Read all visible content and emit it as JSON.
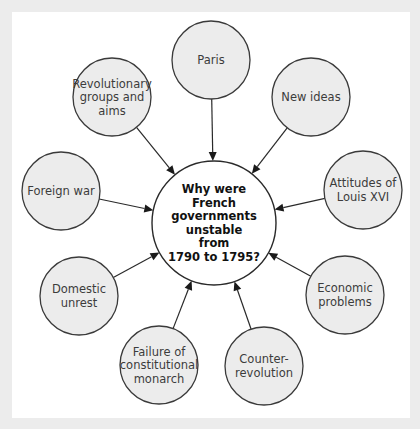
{
  "diagram": {
    "type": "spider",
    "central_question": {
      "lines": [
        "Why were",
        "French",
        "governments",
        "unstable",
        "from",
        "1790 to 1795?"
      ]
    },
    "factors": [
      {
        "id": "paris",
        "lines": [
          "Paris"
        ]
      },
      {
        "id": "new-ideas",
        "lines": [
          "New ideas"
        ]
      },
      {
        "id": "attitudes-louis-xvi",
        "lines": [
          "Attitudes of",
          "Louis XVI"
        ]
      },
      {
        "id": "economic-problems",
        "lines": [
          "Economic",
          "problems"
        ]
      },
      {
        "id": "counter-revolution",
        "lines": [
          "Counter-",
          "revolution"
        ]
      },
      {
        "id": "failure-constitutional-monarch",
        "lines": [
          "Failure of",
          "constitutional",
          "monarch"
        ]
      },
      {
        "id": "domestic-unrest",
        "lines": [
          "Domestic",
          "unrest"
        ]
      },
      {
        "id": "foreign-war",
        "lines": [
          "Foreign war"
        ]
      },
      {
        "id": "revolutionary-groups",
        "lines": [
          "Revolutionary",
          "groups and",
          "aims"
        ]
      }
    ],
    "arrow_direction": "factor-to-center"
  }
}
